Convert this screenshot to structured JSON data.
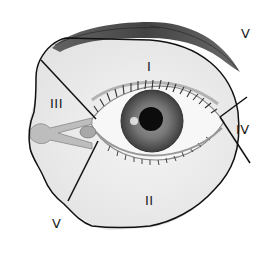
{
  "diagram": {
    "type": "anatomical-region-map",
    "colors": {
      "background": "#ffffff",
      "outline": "#111111",
      "skin_shade": "#e9e9e9",
      "brow": "#3a3a3a",
      "iris": "#6e6e6e",
      "pupil": "#0c0c0c",
      "caruncle": "#b9b9b9"
    },
    "regions": [
      {
        "id": "I",
        "label": "I",
        "location": "upper eyelid / below brow"
      },
      {
        "id": "II",
        "label": "II",
        "location": "lower eyelid / cheek"
      },
      {
        "id": "III",
        "label": "III",
        "location": "medial canthus"
      },
      {
        "id": "IV",
        "label": "IV",
        "location": "lateral canthus"
      },
      {
        "id": "V-top",
        "label": "V",
        "location": "outside boundary, upper right"
      },
      {
        "id": "V-bottom",
        "label": "V",
        "location": "outside boundary, lower left"
      }
    ]
  }
}
